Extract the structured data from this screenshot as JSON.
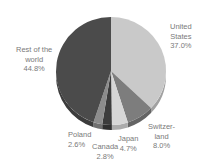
{
  "chart_data": {
    "type": "pie",
    "title": "",
    "start_angle_deg": 0,
    "direction": "clockwise",
    "style": "3d-tilted",
    "slices": [
      {
        "label": "United States",
        "label_lines": [
          "United",
          "States"
        ],
        "value": 37.0,
        "value_text": "37.0%",
        "color": "#c9c9c9"
      },
      {
        "label": "Switzerland",
        "label_lines": [
          "Switzer-",
          "land"
        ],
        "value": 8.0,
        "value_text": "8.0%",
        "color": "#7d7d7d"
      },
      {
        "label": "Japan",
        "label_lines": [
          "Japan"
        ],
        "value": 4.7,
        "value_text": "4.7%",
        "color": "#d6d6d6"
      },
      {
        "label": "Canada",
        "label_lines": [
          "Canada"
        ],
        "value": 2.8,
        "value_text": "2.8%",
        "color": "#3c3c3c"
      },
      {
        "label": "Poland",
        "label_lines": [
          "Poland"
        ],
        "value": 2.6,
        "value_text": "2.6%",
        "color": "#8c8c8c"
      },
      {
        "label": "Rest of the world",
        "label_lines": [
          "Rest of the",
          "world"
        ],
        "value": 44.8,
        "value_text": "44.8%",
        "color": "#4b4b4b"
      }
    ],
    "legend": "none (direct labels)"
  },
  "labels": {
    "us": {
      "line1": "United",
      "line2": "States",
      "value": "37.0%"
    },
    "switzerland": {
      "line1": "Switzer-",
      "line2": "land",
      "value": "8.0%"
    },
    "japan": {
      "line1": "Japan",
      "value": "4.7%"
    },
    "canada": {
      "line1": "Canada",
      "value": "2.8%"
    },
    "poland": {
      "line1": "Poland",
      "value": "2.6%"
    },
    "rest": {
      "line1": "Rest of the",
      "line2": "world",
      "value": "44.8%"
    }
  }
}
